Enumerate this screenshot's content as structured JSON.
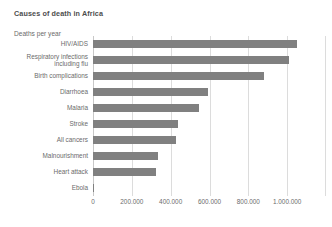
{
  "chart_data": {
    "type": "bar",
    "orientation": "horizontal",
    "title": "Causes of death in Africa",
    "xlabel": "",
    "ylabel": "Deaths per year",
    "axis_title": "Deaths per year",
    "categories": [
      "HIV/AIDS",
      "Respiratory infections\nincluding flu",
      "Birth complications",
      "Diarrhoea",
      "Malaria",
      "Stroke",
      "All cancers",
      "Malnourishment",
      "Heart attack",
      "Ebola"
    ],
    "values": [
      1050000,
      1010000,
      880000,
      590000,
      545000,
      440000,
      430000,
      335000,
      325000,
      5000
    ],
    "xlim": [
      0,
      1200000
    ],
    "xticks": [
      0,
      200000,
      400000,
      600000,
      800000,
      1000000
    ],
    "xticklabels": [
      "0",
      "200.000",
      "400.000",
      "600.000",
      "800.000",
      "1.000.000"
    ],
    "grid": true,
    "grid_axis": "x",
    "legend": false,
    "bar_color": "#808080",
    "grid_color": "#dcdcdc",
    "text_color": "#6b6b6b",
    "title_color": "#4d4d4d",
    "background": "#ffffff"
  }
}
